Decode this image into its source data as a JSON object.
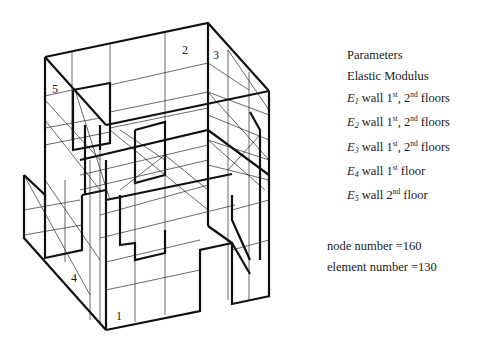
{
  "figure": {
    "wall_labels": [
      "1",
      "2",
      "3",
      "4",
      "5"
    ]
  },
  "legend": {
    "title": "Parameters",
    "subtitle": "Elastic Modulus",
    "items": [
      {
        "symbol": "E",
        "sub": "1",
        "text": "wall 1",
        "sup1": "st",
        "mid": ", 2",
        "sup2": "nd",
        "tail": " floors"
      },
      {
        "symbol": "E",
        "sub": "2",
        "text": "wall 1",
        "sup1": "st",
        "mid": ", 2",
        "sup2": "nd",
        "tail": " floors"
      },
      {
        "symbol": "E",
        "sub": "3",
        "text": "wall 1",
        "sup1": "st",
        "mid": ", 2",
        "sup2": "nd",
        "tail": " floors"
      },
      {
        "symbol": "E",
        "sub": "4",
        "text": "wall 1",
        "sup1": "st",
        "mid": "",
        "sup2": "",
        "tail": " floor"
      },
      {
        "symbol": "E",
        "sub": "5",
        "text": "wall 2",
        "sup1": "nd",
        "mid": "",
        "sup2": "",
        "tail": " floor"
      }
    ]
  },
  "stats": {
    "node_number": "node number =160",
    "element_number": "element number =130"
  }
}
